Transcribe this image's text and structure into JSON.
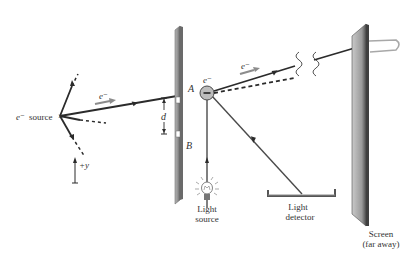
{
  "labels": {
    "source_prefix": "e⁻",
    "source_word": "source",
    "electron_upper": "e⁻",
    "electron_beam_left": "e⁻",
    "electron_beam_right": "e⁻",
    "slit_a": "A",
    "slit_b": "B",
    "separation": "d",
    "axis": "+y",
    "light_source_line1": "Light",
    "light_source_line2": "source",
    "detector_line1": "Light",
    "detector_line2": "detector",
    "screen_line1": "Screen",
    "screen_line2": "(far away)"
  },
  "colors": {
    "line": "#2b2b2b",
    "barrier": "#9a9a9a",
    "barrier_dark": "#6f6f6f",
    "screen_light": "#b8b8b8",
    "screen_dark": "#5a5a5a",
    "hook": "#a8a8a8",
    "electron_fill": "#bdbdbd",
    "arrow_gray": "#8c8c8c",
    "text": "#333333"
  }
}
